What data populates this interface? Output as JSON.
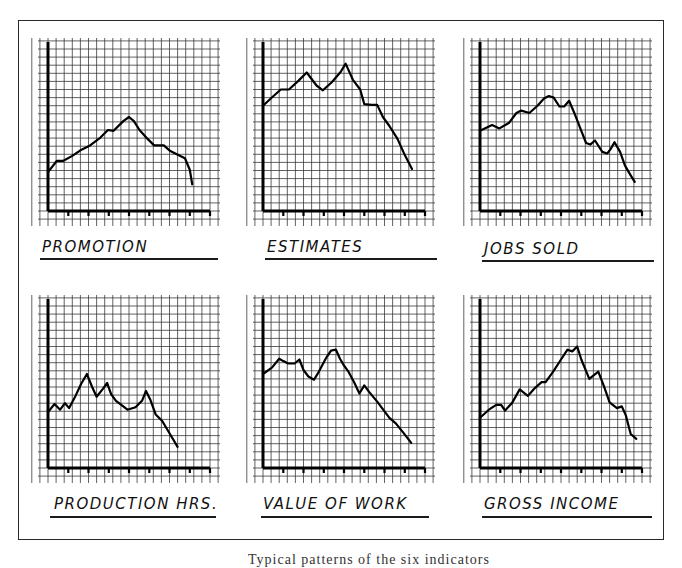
{
  "figure": {
    "caption": "Typical patterns of the six indicators"
  },
  "chart_data": [
    {
      "type": "line",
      "title": "PROMOTION",
      "grid": true,
      "xlabel": "",
      "ylabel": "",
      "x_ticks": 8,
      "ylim": [
        0,
        21
      ],
      "xlim": [
        0,
        20
      ],
      "x": [
        0,
        1.1,
        1.9,
        3,
        4,
        5.2,
        6.5,
        7.4,
        8.1,
        9.3,
        10,
        10.6,
        11.3,
        12.3,
        13.1,
        13.8,
        14.3,
        15.1,
        15.9,
        16.9,
        17.5,
        17.8
      ],
      "values": [
        4.8,
        6.2,
        6.2,
        6.8,
        7.5,
        8.1,
        9.1,
        10,
        9.9,
        11.1,
        11.6,
        11.1,
        10,
        8.9,
        8.1,
        8.1,
        8.1,
        7.4,
        7,
        6.5,
        5.1,
        3.3
      ]
    },
    {
      "type": "line",
      "title": "ESTIMATES",
      "grid": true,
      "xlabel": "",
      "ylabel": "",
      "x_ticks": 8,
      "ylim": [
        0,
        21
      ],
      "xlim": [
        0,
        20
      ],
      "x": [
        0,
        1.2,
        2.2,
        3.2,
        4.4,
        5.4,
        6.6,
        7.4,
        8.5,
        9.6,
        10.2,
        11.1,
        12,
        12.5,
        13.4,
        14.1,
        14.8,
        15.6,
        16.6,
        17.5,
        18.4
      ],
      "values": [
        13,
        14.1,
        15,
        15,
        16.1,
        17.1,
        15.5,
        14.9,
        15.9,
        17.2,
        18.2,
        16.2,
        15,
        13.2,
        13.1,
        13.1,
        11.6,
        10.5,
        8.9,
        6.9,
        5.2
      ]
    },
    {
      "type": "line",
      "title": "JOBS SOLD",
      "grid": true,
      "xlabel": "",
      "ylabel": "",
      "x_ticks": 8,
      "ylim": [
        0,
        21
      ],
      "xlim": [
        0,
        20
      ],
      "x": [
        0,
        1.5,
        2.4,
        3.6,
        4.5,
        5.1,
        6.1,
        7.1,
        7.9,
        8.5,
        9.1,
        9.8,
        10.4,
        11,
        11.6,
        12.5,
        13.1,
        13.6,
        14.2,
        15.1,
        15.7,
        16.1,
        16.6,
        17.3,
        17.9,
        18.6,
        19.1
      ],
      "values": [
        9.9,
        10.6,
        10.2,
        10.9,
        12.1,
        12.4,
        12.1,
        13,
        13.9,
        14.2,
        14,
        12.9,
        12.9,
        13.6,
        12.2,
        9.9,
        8.4,
        8.2,
        8.7,
        7.3,
        7.1,
        7.6,
        8.5,
        7.3,
        5.6,
        4.4,
        3.6
      ]
    },
    {
      "type": "line",
      "title": "PRODUCTION HRS.",
      "grid": true,
      "xlabel": "",
      "ylabel": "",
      "x_ticks": 8,
      "ylim": [
        0,
        21
      ],
      "xlim": [
        0,
        20
      ],
      "x": [
        0,
        0.8,
        1.5,
        2.1,
        2.6,
        3.4,
        4.1,
        4.8,
        5.5,
        6,
        6.8,
        7.3,
        7.8,
        8.4,
        9.3,
        9.8,
        10.8,
        11.6,
        12.1,
        12.6,
        13.3,
        14.1,
        15,
        16
      ],
      "values": [
        6.9,
        7.9,
        7.2,
        8,
        7.4,
        8.9,
        10.4,
        11.6,
        9.9,
        8.8,
        9.8,
        10.5,
        9.1,
        8.3,
        7.6,
        7.2,
        7.5,
        8.3,
        9.5,
        8.5,
        6.6,
        5.8,
        4.3,
        2.6
      ]
    },
    {
      "type": "line",
      "title": "VALUE OF WORK",
      "grid": true,
      "xlabel": "",
      "ylabel": "",
      "x_ticks": 8,
      "ylim": [
        0,
        21
      ],
      "xlim": [
        0,
        20
      ],
      "x": [
        0,
        1.1,
        2,
        2.5,
        3.1,
        3.9,
        4.5,
        5,
        5.6,
        6.3,
        6.9,
        7.8,
        8.4,
        9,
        9.5,
        9.9,
        10.6,
        11.3,
        11.9,
        12.5,
        13.1,
        14.1,
        15,
        15.6,
        16.4,
        17.3,
        18.3
      ],
      "values": [
        11.6,
        12.4,
        13.5,
        13.2,
        12.9,
        12.9,
        13.4,
        12.1,
        11.3,
        10.9,
        11.9,
        13.6,
        14.5,
        14.6,
        13.5,
        12.8,
        11.8,
        10.5,
        9.2,
        10.2,
        9.4,
        8.2,
        7,
        6.2,
        5.5,
        4.4,
        3.1
      ]
    },
    {
      "type": "line",
      "title": "GROSS INCOME",
      "grid": true,
      "xlabel": "",
      "ylabel": "",
      "x_ticks": 8,
      "ylim": [
        0,
        21
      ],
      "xlim": [
        0,
        20
      ],
      "x": [
        0,
        1.1,
        2,
        2.6,
        3.1,
        4,
        4.9,
        5.9,
        6.8,
        7.6,
        8.1,
        9.1,
        10,
        10.8,
        11.4,
        12,
        12.5,
        13.5,
        14.6,
        15.3,
        16,
        16.9,
        17.5,
        18,
        18.6,
        19.3
      ],
      "values": [
        6.2,
        7.2,
        7.8,
        7.8,
        7.1,
        8.1,
        9.7,
        8.9,
        9.9,
        10.6,
        10.6,
        12,
        13.4,
        14.6,
        14.4,
        15,
        13.4,
        11,
        11.9,
        10.1,
        8.1,
        7.4,
        7.6,
        6.5,
        4.2,
        3.6
      ]
    }
  ]
}
